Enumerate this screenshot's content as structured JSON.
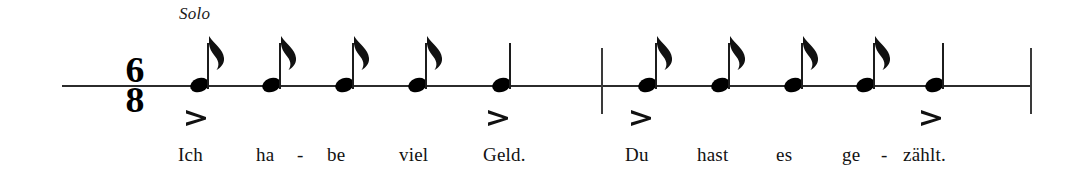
{
  "score": {
    "performance_marking": "Solo",
    "time_signature": {
      "numerator": "6",
      "denominator": "8"
    },
    "staff": {
      "line_color": "#2b2b2b"
    },
    "notes": [
      {
        "id": "note-1",
        "type": "eighth",
        "x": 190,
        "measure": 1
      },
      {
        "id": "note-2",
        "type": "eighth",
        "x": 262,
        "measure": 1
      },
      {
        "id": "note-3",
        "type": "eighth",
        "x": 335,
        "measure": 1
      },
      {
        "id": "note-4",
        "type": "eighth",
        "x": 408,
        "measure": 1
      },
      {
        "id": "note-5",
        "type": "quarter",
        "x": 492,
        "measure": 1
      },
      {
        "id": "note-6",
        "type": "eighth",
        "x": 638,
        "measure": 2
      },
      {
        "id": "note-7",
        "type": "eighth",
        "x": 711,
        "measure": 2
      },
      {
        "id": "note-8",
        "type": "eighth",
        "x": 784,
        "measure": 2
      },
      {
        "id": "note-9",
        "type": "eighth",
        "x": 856,
        "measure": 2
      },
      {
        "id": "note-10",
        "type": "quarter",
        "x": 925,
        "measure": 2
      }
    ],
    "barlines": [
      {
        "id": "barline-1",
        "x": 601,
        "kind": "single"
      },
      {
        "id": "barline-final",
        "x": 1030,
        "kind": "single"
      }
    ],
    "accents": [
      {
        "id": "accent-1",
        "x": 185,
        "over_syllable": "Ich"
      },
      {
        "id": "accent-2",
        "x": 487,
        "over_syllable": "Geld."
      },
      {
        "id": "accent-3",
        "x": 630,
        "over_syllable": "Du"
      },
      {
        "id": "accent-4",
        "x": 920,
        "over_syllable": "zählt."
      }
    ],
    "lyrics": [
      {
        "id": "lyric-ich",
        "text": "Ich",
        "x": 178
      },
      {
        "id": "lyric-ha",
        "text": "ha",
        "x": 256
      },
      {
        "id": "lyric-hy-1",
        "text": "-",
        "x": 297
      },
      {
        "id": "lyric-be",
        "text": "be",
        "x": 327
      },
      {
        "id": "lyric-viel",
        "text": "viel",
        "x": 399
      },
      {
        "id": "lyric-geld",
        "text": "Geld.",
        "x": 483
      },
      {
        "id": "lyric-du",
        "text": "Du",
        "x": 625
      },
      {
        "id": "lyric-hast",
        "text": "hast",
        "x": 697
      },
      {
        "id": "lyric-es",
        "text": "es",
        "x": 776
      },
      {
        "id": "lyric-ge",
        "text": "ge",
        "x": 842
      },
      {
        "id": "lyric-hy-2",
        "text": "-",
        "x": 881
      },
      {
        "id": "lyric-zahlt",
        "text": "zählt.",
        "x": 903
      }
    ]
  }
}
